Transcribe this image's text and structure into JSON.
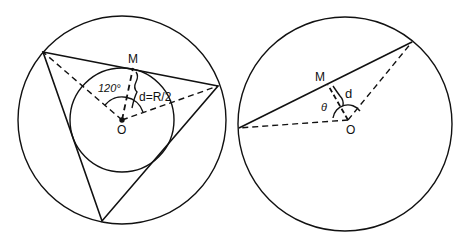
{
  "left_figure": {
    "labels": {
      "midpoint": "M",
      "angle": "120°",
      "distance": "d=R/2",
      "center": "O"
    }
  },
  "right_figure": {
    "labels": {
      "midpoint": "M",
      "angle": "θ",
      "distance": "d",
      "center": "O"
    }
  },
  "colors": {
    "stroke": "#111111",
    "background": "#ffffff"
  }
}
